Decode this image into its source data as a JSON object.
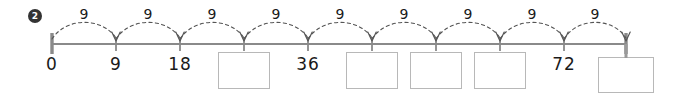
{
  "problem": {
    "number": "2"
  },
  "numberline": {
    "start_value": 0,
    "end_value": 81,
    "step": 9,
    "tick_count": 10,
    "line_color": "#8a8a8a",
    "arc_color": "#555555",
    "box_border_color": "#b8b8b8",
    "ticks": [
      {
        "index": 0,
        "value": "0",
        "label": "0",
        "filled": true,
        "x": 52
      },
      {
        "index": 1,
        "value": "9",
        "label": "9",
        "filled": true,
        "x": 116
      },
      {
        "index": 2,
        "value": "18",
        "label": "18",
        "filled": true,
        "x": 180
      },
      {
        "index": 3,
        "value": "27",
        "label": "",
        "filled": false,
        "x": 244
      },
      {
        "index": 4,
        "value": "36",
        "label": "36",
        "filled": true,
        "x": 308
      },
      {
        "index": 5,
        "value": "45",
        "label": "",
        "filled": false,
        "x": 372
      },
      {
        "index": 6,
        "value": "54",
        "label": "",
        "filled": false,
        "x": 436
      },
      {
        "index": 7,
        "value": "63",
        "label": "",
        "filled": false,
        "x": 500
      },
      {
        "index": 8,
        "value": "72",
        "label": "72",
        "filled": true,
        "x": 564
      },
      {
        "index": 9,
        "value": "81",
        "label": "",
        "filled": false,
        "x": 626
      }
    ],
    "hops": [
      {
        "label": "9",
        "from": 0,
        "to": 1
      },
      {
        "label": "9",
        "from": 1,
        "to": 2
      },
      {
        "label": "9",
        "from": 2,
        "to": 3
      },
      {
        "label": "9",
        "from": 3,
        "to": 4
      },
      {
        "label": "9",
        "from": 4,
        "to": 5
      },
      {
        "label": "9",
        "from": 5,
        "to": 6
      },
      {
        "label": "9",
        "from": 6,
        "to": 7
      },
      {
        "label": "9",
        "from": 7,
        "to": 8
      },
      {
        "label": "9",
        "from": 8,
        "to": 9
      }
    ]
  }
}
